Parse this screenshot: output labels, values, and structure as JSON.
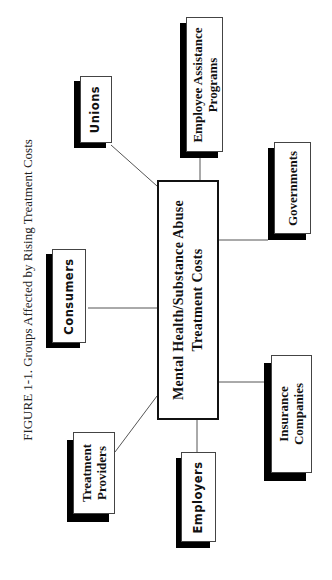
{
  "figure": {
    "caption": "FIGURE 1-1. Groups Affected by Rising Treatment Costs"
  },
  "center": {
    "line1": "Mental Health/Substance Abuse",
    "line2": "Treatment Costs"
  },
  "nodes": {
    "unions": {
      "line1": "Unions"
    },
    "consumers": {
      "line1": "Consumers"
    },
    "treatment_providers": {
      "line1": "Treatment",
      "line2": "Providers"
    },
    "employers": {
      "line1": "Employers"
    },
    "insurance_companies": {
      "line1": "Insurance",
      "line2": "Companies"
    },
    "governments": {
      "line1": "Governments"
    },
    "employee_assistance_programs": {
      "line1": "Employee Assistance",
      "line2": "Programs"
    }
  },
  "colors": {
    "line": "#555555",
    "shadow": "#000000",
    "box_border": "#444444"
  }
}
